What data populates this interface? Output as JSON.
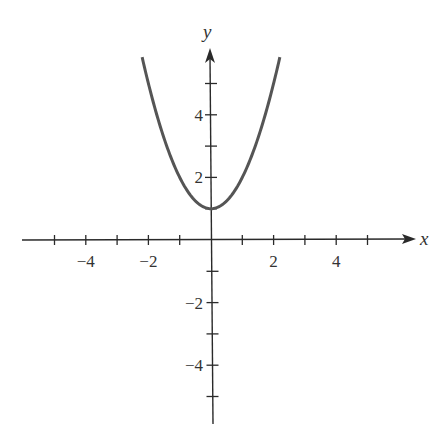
{
  "chart_data": {
    "type": "line",
    "title": "",
    "function": "y = x^2 + 1",
    "xlabel": "x",
    "ylabel": "y",
    "xlim": [
      -5,
      6
    ],
    "ylim": [
      -6,
      6
    ],
    "grid": false,
    "legend": null,
    "x_ticks": [
      -5,
      -4,
      -3,
      -2,
      -1,
      1,
      2,
      3,
      4,
      5
    ],
    "x_tick_labels": [
      {
        "value": -4,
        "label": "−4"
      },
      {
        "value": -2,
        "label": "−2"
      },
      {
        "value": 2,
        "label": "2"
      },
      {
        "value": 4,
        "label": "4"
      }
    ],
    "y_ticks": [
      -5,
      -4,
      -3,
      -2,
      -1,
      1,
      2,
      3,
      4,
      5
    ],
    "y_tick_labels": [
      {
        "value": 4,
        "label": "4"
      },
      {
        "value": 2,
        "label": "2"
      },
      {
        "value": -2,
        "label": "−2"
      },
      {
        "value": -4,
        "label": "−4"
      }
    ],
    "series": [
      {
        "name": "y = x^2 + 1",
        "color": "#555555",
        "x": [
          -2.2,
          -2.0,
          -1.5,
          -1.0,
          -0.5,
          0.0,
          0.5,
          1.0,
          1.5,
          2.0,
          2.2
        ],
        "y": [
          5.84,
          5.0,
          3.25,
          2.0,
          1.25,
          1.0,
          1.25,
          2.0,
          3.25,
          5.0,
          5.84
        ]
      }
    ],
    "vertex": {
      "x": 0,
      "y": 1
    }
  },
  "layout": {
    "origin_px": [
      211,
      240
    ],
    "unit_px": 31.3,
    "x_axis_px": [
      22,
      416
    ],
    "y_axis_px": [
      48,
      424
    ],
    "axis_color": "#2a2a2a"
  }
}
